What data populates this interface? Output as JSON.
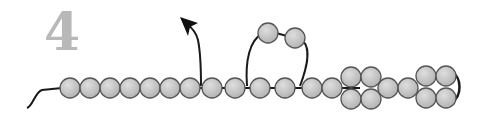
{
  "figure": {
    "step_number": "4",
    "colors": {
      "bead_fill": "#c4c4c4",
      "bead_stroke": "#555555",
      "strand": "#1a1a1a",
      "step_number": "#b8b8b8"
    },
    "bead_radius": 10,
    "main_chain_beads": [
      {
        "x": 70,
        "y": 88
      },
      {
        "x": 90,
        "y": 88
      },
      {
        "x": 110,
        "y": 88
      },
      {
        "x": 130,
        "y": 88
      },
      {
        "x": 150,
        "y": 88
      },
      {
        "x": 170,
        "y": 88
      },
      {
        "x": 190,
        "y": 88
      },
      {
        "x": 212,
        "y": 88
      },
      {
        "x": 235,
        "y": 88
      },
      {
        "x": 260,
        "y": 88
      },
      {
        "x": 285,
        "y": 88
      },
      {
        "x": 312,
        "y": 88
      },
      {
        "x": 332,
        "y": 88
      }
    ],
    "loop_beads": [
      {
        "x": 268,
        "y": 33
      },
      {
        "x": 295,
        "y": 38
      }
    ],
    "cluster_1_beads": [
      {
        "x": 351,
        "y": 77
      },
      {
        "x": 351,
        "y": 99
      },
      {
        "x": 371,
        "y": 77
      },
      {
        "x": 371,
        "y": 99
      }
    ],
    "mid_beads": [
      {
        "x": 388,
        "y": 88
      },
      {
        "x": 408,
        "y": 88
      }
    ],
    "cluster_2_beads": [
      {
        "x": 426,
        "y": 76
      },
      {
        "x": 426,
        "y": 98
      },
      {
        "x": 446,
        "y": 76
      },
      {
        "x": 446,
        "y": 98
      }
    ],
    "labels": {
      "arrow": "needle-direction-arrow",
      "tail": "thread-tail"
    }
  }
}
